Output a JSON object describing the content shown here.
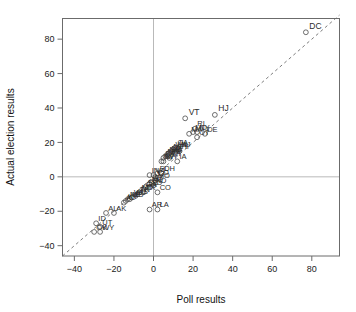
{
  "chart_data": {
    "type": "scatter",
    "title": "",
    "xlabel": "Poll results",
    "ylabel": "Actual election results",
    "xlim": [
      -46,
      94
    ],
    "ylim": [
      -46,
      92
    ],
    "xticks": [
      -40,
      -20,
      0,
      20,
      40,
      60,
      80
    ],
    "yticks": [
      -40,
      -20,
      0,
      20,
      40,
      60,
      80
    ],
    "xticklabels": [
      "−40",
      "−20",
      "0",
      "20",
      "40",
      "60",
      "80"
    ],
    "yticklabels": [
      "−40",
      "−20",
      "0",
      "20",
      "40",
      "60",
      "80"
    ],
    "grid": false,
    "legend": null,
    "reference_lines": [
      {
        "name": "identity-line",
        "type": "diagonal",
        "style": "dashed",
        "from": [
          -46,
          -46
        ],
        "to": [
          94,
          94
        ]
      },
      {
        "name": "x-zero-line",
        "type": "vertical",
        "style": "solid",
        "value": 0
      },
      {
        "name": "y-zero-line",
        "type": "horizontal",
        "style": "solid",
        "value": 0
      }
    ],
    "marker": "open-circle",
    "point_label_field": "state",
    "points": [
      {
        "state": "DC",
        "x": 77,
        "y": 84
      },
      {
        "state": "HJ",
        "x": 31,
        "y": 36
      },
      {
        "state": "VT",
        "x": 16,
        "y": 34
      },
      {
        "state": "DE",
        "x": 26,
        "y": 25
      },
      {
        "state": "RI",
        "x": 21,
        "y": 28
      },
      {
        "state": "NY",
        "x": 22,
        "y": 26
      },
      {
        "state": "MA",
        "x": 18,
        "y": 25
      },
      {
        "state": "CT",
        "x": 22,
        "y": 23
      },
      {
        "state": "MD",
        "x": 20,
        "y": 26
      },
      {
        "state": "NJ",
        "x": 13,
        "y": 16
      },
      {
        "state": "IL",
        "x": 12,
        "y": 17
      },
      {
        "state": "CA",
        "x": 11,
        "y": 17
      },
      {
        "state": "WA",
        "x": 10,
        "y": 16
      },
      {
        "state": "HI",
        "x": 13,
        "y": 15
      },
      {
        "state": "MI",
        "x": 9,
        "y": 15
      },
      {
        "state": "ME",
        "x": 8,
        "y": 14
      },
      {
        "state": "NM",
        "x": 7,
        "y": 13
      },
      {
        "state": "OR",
        "x": 7,
        "y": 12
      },
      {
        "state": "WI",
        "x": 8,
        "y": 11
      },
      {
        "state": "MN",
        "x": 6,
        "y": 12
      },
      {
        "state": "PA",
        "x": 5,
        "y": 11
      },
      {
        "state": "IA",
        "x": 12,
        "y": 9
      },
      {
        "state": "NH",
        "x": 5,
        "y": 9
      },
      {
        "state": "NV",
        "x": 4,
        "y": 9
      },
      {
        "state": "OH",
        "x": 4,
        "y": 2
      },
      {
        "state": "FL",
        "x": 2,
        "y": 2
      },
      {
        "state": "IN",
        "x": -2,
        "y": 1
      },
      {
        "state": "VA",
        "x": 0,
        "y": 1
      },
      {
        "state": "CO",
        "x": 1,
        "y": 0
      },
      {
        "state": "MO",
        "x": 1,
        "y": -2
      },
      {
        "state": "AZ",
        "x": -1,
        "y": -3
      },
      {
        "state": "NC",
        "x": -2,
        "y": -4
      },
      {
        "state": "ND",
        "x": 0,
        "y": -5
      },
      {
        "state": "SD",
        "x": -2,
        "y": -6
      },
      {
        "state": "SC",
        "x": -4,
        "y": -6
      },
      {
        "state": "GA",
        "x": -5,
        "y": -7
      },
      {
        "state": "TX",
        "x": -5,
        "y": -9
      },
      {
        "state": "MT",
        "x": -7,
        "y": -9
      },
      {
        "state": "CO2",
        "x": 2,
        "y": -9
      },
      {
        "state": "TN",
        "x": -8,
        "y": -10
      },
      {
        "state": "KS",
        "x": -9,
        "y": -11
      },
      {
        "state": "WV",
        "x": -11,
        "y": -12
      },
      {
        "state": "MS",
        "x": -12,
        "y": -13
      },
      {
        "state": "NE",
        "x": -13,
        "y": -13
      },
      {
        "state": "KY",
        "x": -14,
        "y": -14
      },
      {
        "state": "AL2",
        "x": -15,
        "y": -15
      },
      {
        "state": "AR",
        "x": -2,
        "y": -19
      },
      {
        "state": "LA",
        "x": 2,
        "y": -19
      },
      {
        "state": "AL",
        "x": -24,
        "y": -21
      },
      {
        "state": "AK",
        "x": -20,
        "y": -21
      },
      {
        "state": "ID",
        "x": -29,
        "y": -27
      },
      {
        "state": "UT",
        "x": -27,
        "y": -29
      },
      {
        "state": "OK",
        "x": -30,
        "y": -32
      },
      {
        "state": "WY",
        "x": -27,
        "y": -32
      }
    ]
  },
  "axes": {
    "xlabel": "Poll results",
    "ylabel": "Actual election results"
  }
}
